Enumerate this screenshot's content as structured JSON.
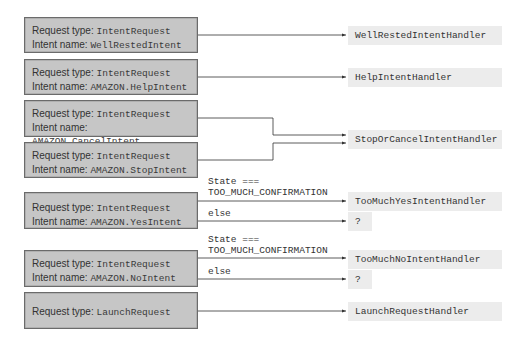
{
  "labels": {
    "request_type": "Request type: ",
    "intent_name": "Intent name: "
  },
  "requests": [
    {
      "type": "IntentRequest",
      "intent": "WellRestedIntent"
    },
    {
      "type": "IntentRequest",
      "intent": "AMAZON.HelpIntent"
    },
    {
      "type": "IntentRequest",
      "intent": "AMAZON.CancelIntent"
    },
    {
      "type": "IntentRequest",
      "intent": "AMAZON.StopIntent"
    },
    {
      "type": "IntentRequest",
      "intent": "AMAZON.YesIntent"
    },
    {
      "type": "IntentRequest",
      "intent": "AMAZON.NoIntent"
    },
    {
      "type": "LaunchRequest"
    }
  ],
  "handlers": [
    "WellRestedIntentHandler",
    "HelpIntentHandler",
    "StopOrCancelIntentHandler",
    "TooMuchYesIntentHandler",
    "?",
    "TooMuchNoIntentHandler",
    "?",
    "LaunchRequestHandler"
  ],
  "conditions": {
    "state_line1": "State ===",
    "state_line2": "TOO_MUCH_CONFIRMATION",
    "else": "else"
  },
  "colors": {
    "request_box": "#c6c6c6",
    "handler_box": "#ececec",
    "line": "#333333"
  }
}
